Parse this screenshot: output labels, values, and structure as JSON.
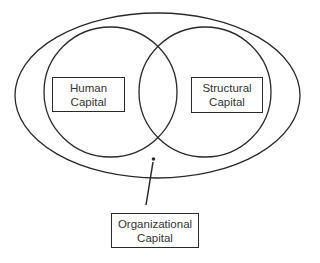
{
  "diagram": {
    "type": "venn-with-container",
    "outer": {
      "label": "Organizational Capital"
    },
    "circles": [
      {
        "id": "human",
        "label_line1": "Human",
        "label_line2": "Capital"
      },
      {
        "id": "structural",
        "label_line1": "Structural",
        "label_line2": "Capital"
      }
    ],
    "callout": {
      "label_line1": "Organizational",
      "label_line2": "Capital",
      "points_to": "outer-ellipse"
    },
    "colors": {
      "stroke": "#2a2a2a",
      "text": "#333333",
      "background": "#ffffff"
    }
  }
}
